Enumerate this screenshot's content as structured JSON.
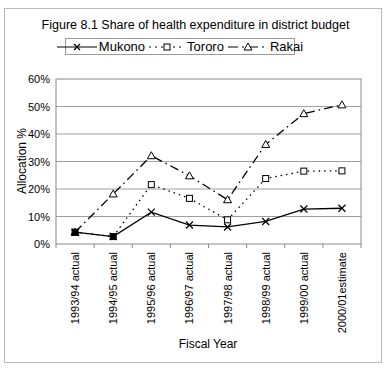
{
  "chart_data": {
    "type": "line",
    "title": "Figure 8.1 Share of health expenditure in district budget",
    "xlabel": "Fiscal Year",
    "ylabel": "Allocation %",
    "ylim": [
      0,
      60
    ],
    "yticks": [
      "0%",
      "10%",
      "20%",
      "30%",
      "40%",
      "50%",
      "60%"
    ],
    "grid": true,
    "legend_position": "top",
    "categories": [
      "1993/94 actual",
      "1994/95 actual",
      "1995/96 actual",
      "1996/97 actual",
      "1997/98 actual",
      "1998/99 actual",
      "1999/00 actual",
      "2000/01estimate"
    ],
    "series": [
      {
        "name": "Mukono",
        "style": "solid",
        "marker": "x",
        "values": [
          4.3,
          2.7,
          11.6,
          6.9,
          6.2,
          8.2,
          12.7,
          13.0
        ]
      },
      {
        "name": "Tororo",
        "style": "dotted",
        "marker": "square",
        "values": [
          4.3,
          2.7,
          21.6,
          16.6,
          8.8,
          23.8,
          26.5,
          26.6
        ]
      },
      {
        "name": "Rakai",
        "style": "dashdot",
        "marker": "triangle",
        "values": [
          4.3,
          18.2,
          32.1,
          24.8,
          16.1,
          36.2,
          47.4,
          50.6
        ]
      }
    ]
  },
  "legend": {
    "items": [
      "Mukono",
      "Tororo",
      "Rakai"
    ]
  }
}
